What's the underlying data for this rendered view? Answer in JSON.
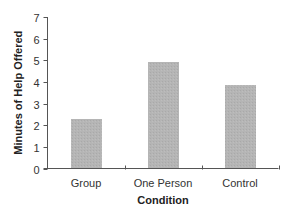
{
  "chart_data": {
    "type": "bar",
    "title": "",
    "xlabel": "Condition",
    "ylabel": "Minutes of Help Offered",
    "categories": [
      "Group",
      "One Person",
      "Control"
    ],
    "values": [
      2.3,
      4.9,
      3.85
    ],
    "ylim": [
      0,
      7
    ],
    "yticks": [
      "0",
      "1",
      "2",
      "3",
      "4",
      "5",
      "6",
      "7"
    ],
    "grid": false,
    "legend": "none",
    "bar_color": "#b5b5b5"
  }
}
